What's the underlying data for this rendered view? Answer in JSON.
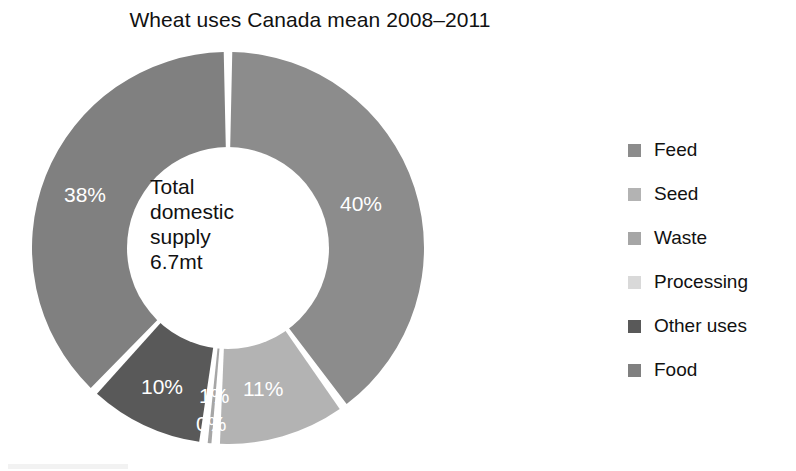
{
  "chart_data": {
    "type": "pie",
    "variant": "donut",
    "title": "Wheat uses Canada mean 2008–2011",
    "center_label": "Total domestic supply 6.7mt",
    "center_lines": [
      "Total",
      "domestic",
      "supply",
      "6.7mt"
    ],
    "categories": [
      "Feed",
      "Seed",
      "Waste",
      "Processing",
      "Other uses",
      "Food"
    ],
    "values": [
      40,
      11,
      1,
      0,
      10,
      38
    ],
    "value_labels": [
      "40%",
      "11%",
      "1%",
      "0%",
      "10%",
      "38%"
    ],
    "units": "percent",
    "total_label": "6.7mt",
    "legend_position": "right",
    "start_angle_deg": 0,
    "direction": "clockwise",
    "colors": [
      "#8c8c8c",
      "#b3b3b3",
      "#a6a6a6",
      "#d9d9d9",
      "#595959",
      "#808080"
    ],
    "label_color": "#ffffff",
    "slice_gap": true,
    "series": [
      {
        "name": "Wheat uses Canada mean 2008–2011",
        "points": [
          {
            "label": "Feed",
            "value": 40,
            "display": "40%",
            "color": "#8c8c8c"
          },
          {
            "label": "Seed",
            "value": 11,
            "display": "11%",
            "color": "#b3b3b3"
          },
          {
            "label": "Waste",
            "value": 1,
            "display": "1%",
            "color": "#a6a6a6"
          },
          {
            "label": "Processing",
            "value": 0,
            "display": "0%",
            "color": "#d9d9d9"
          },
          {
            "label": "Other uses",
            "value": 10,
            "display": "10%",
            "color": "#595959"
          },
          {
            "label": "Food",
            "value": 38,
            "display": "38%",
            "color": "#808080"
          }
        ]
      }
    ]
  },
  "title": "Wheat uses Canada mean 2008–2011",
  "center": {
    "line1": "Total",
    "line2": "domestic",
    "line3": "supply",
    "line4": "6.7mt"
  },
  "slice_labels": {
    "feed": "40%",
    "seed": "11%",
    "waste": "1%",
    "processing": "0%",
    "other_uses": "10%",
    "food": "38%"
  },
  "legend": {
    "items": [
      {
        "label": "Feed",
        "color": "#8c8c8c"
      },
      {
        "label": "Seed",
        "color": "#b3b3b3"
      },
      {
        "label": "Waste",
        "color": "#a6a6a6"
      },
      {
        "label": "Processing",
        "color": "#d9d9d9"
      },
      {
        "label": "Other uses",
        "color": "#595959"
      },
      {
        "label": "Food",
        "color": "#808080"
      }
    ]
  }
}
